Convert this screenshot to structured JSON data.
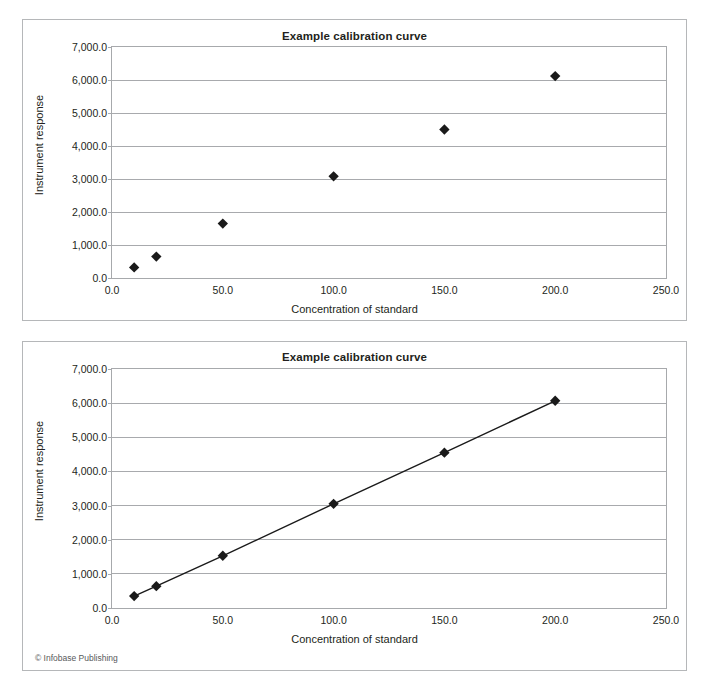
{
  "figure": {
    "credit": "© Infobase Publishing",
    "panels": [
      {
        "id": "scatter",
        "title": "Example calibration curve",
        "xlabel": "Concentration of standard",
        "ylabel": "Instrument response"
      },
      {
        "id": "line",
        "title": "Example calibration curve",
        "xlabel": "Concentration of standard",
        "ylabel": "Instrument response"
      }
    ]
  },
  "chart_data": [
    {
      "type": "scatter",
      "title": "Example calibration curve",
      "xlabel": "Concentration of standard",
      "ylabel": "Instrument response",
      "xlim": [
        0,
        250
      ],
      "ylim": [
        0,
        7000
      ],
      "xticks": [
        0,
        50,
        100,
        150,
        200,
        250
      ],
      "xtick_labels": [
        "0.0",
        "50.0",
        "100.0",
        "150.0",
        "200.0",
        "250.0"
      ],
      "yticks": [
        0,
        1000,
        2000,
        3000,
        4000,
        5000,
        6000,
        7000
      ],
      "ytick_labels": [
        "0.0",
        "1,000.0",
        "2,000.0",
        "3,000.0",
        "4,000.0",
        "5,000.0",
        "6,000.0",
        "7,000.0"
      ],
      "grid": "horizontal",
      "legend": "none",
      "marker": "diamond",
      "marker_color": "#1a1a1a",
      "series": [
        {
          "name": "Standards",
          "x": [
            10,
            20,
            50,
            100,
            150,
            200
          ],
          "y": [
            320,
            650,
            1650,
            3080,
            4500,
            6120
          ]
        }
      ]
    },
    {
      "type": "line",
      "title": "Example calibration curve",
      "xlabel": "Concentration of standard",
      "ylabel": "Instrument response",
      "xlim": [
        0,
        250
      ],
      "ylim": [
        0,
        7000
      ],
      "xticks": [
        0,
        50,
        100,
        150,
        200,
        250
      ],
      "xtick_labels": [
        "0.0",
        "50.0",
        "100.0",
        "150.0",
        "200.0",
        "250.0"
      ],
      "yticks": [
        0,
        1000,
        2000,
        3000,
        4000,
        5000,
        6000,
        7000
      ],
      "ytick_labels": [
        "0.0",
        "1,000.0",
        "2,000.0",
        "3,000.0",
        "4,000.0",
        "5,000.0",
        "6,000.0",
        "7,000.0"
      ],
      "grid": "horizontal",
      "legend": "none",
      "marker": "diamond",
      "marker_color": "#1a1a1a",
      "line_color": "#1a1a1a",
      "series": [
        {
          "name": "Standards",
          "x": [
            10,
            20,
            50,
            100,
            150,
            200
          ],
          "y": [
            350,
            640,
            1530,
            3050,
            4550,
            6070
          ]
        }
      ]
    }
  ]
}
